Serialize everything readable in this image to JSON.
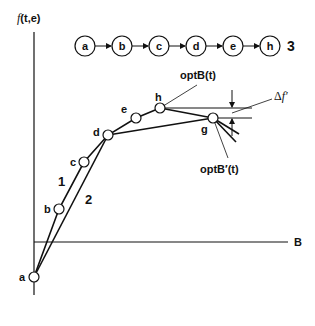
{
  "axes": {
    "y_label_prefix": "f",
    "y_label_suffix": "(t,e)",
    "x_label": "B"
  },
  "chain": {
    "nodes": [
      "a",
      "b",
      "c",
      "d",
      "e",
      "h"
    ],
    "label": "3"
  },
  "points": {
    "a": "a",
    "b": "b",
    "c": "c",
    "d": "d",
    "e": "e",
    "h": "h",
    "g": "g"
  },
  "path_labels": {
    "path1": "1",
    "path2": "2"
  },
  "annotations": {
    "optB": "optB(t)",
    "optB_prime": "optB′(t)",
    "delta_prefix": "Δ",
    "delta_f": "f′"
  },
  "colors": {
    "line": "#111111",
    "background": "#ffffff"
  }
}
